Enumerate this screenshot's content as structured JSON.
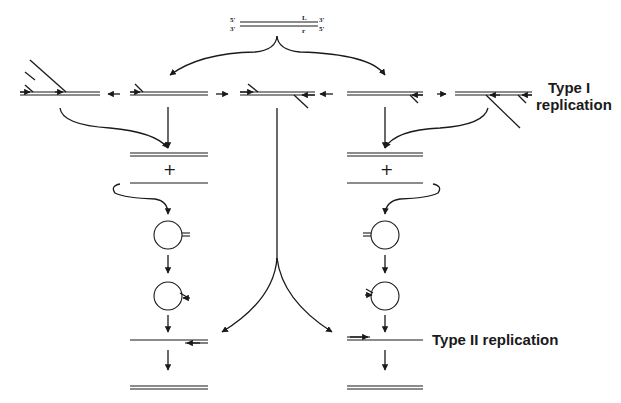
{
  "figure": {
    "type_i_label": {
      "line1": "Type I",
      "line2": "replication"
    },
    "type_ii_label": "Type II replication",
    "parent_duplex": {
      "top_left_end": "5'",
      "bottom_left_end": "3'",
      "top_right_end": "3'",
      "bottom_right_end": "5'",
      "top_strand_mark": "L",
      "bottom_strand_mark": "r"
    },
    "plus_sign": "+",
    "colors": {
      "ink": "#1a1a1a",
      "background": "#ffffff"
    }
  }
}
